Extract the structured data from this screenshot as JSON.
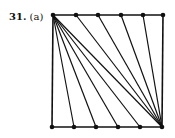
{
  "figure": {
    "number": "31.",
    "part": "(a)"
  },
  "diagram": {
    "stroke": "#111111",
    "square": {
      "tl": [
        53,
        15
      ],
      "tr": [
        163,
        15
      ],
      "br": [
        162,
        127
      ],
      "bl": [
        52,
        127
      ]
    },
    "top_points": [
      [
        53,
        15
      ],
      [
        76,
        15
      ],
      [
        98,
        15
      ],
      [
        121,
        15
      ],
      [
        143,
        15
      ],
      [
        163,
        15
      ]
    ],
    "bottom_points": [
      [
        52,
        127
      ],
      [
        74,
        127
      ],
      [
        96,
        127
      ],
      [
        118,
        127
      ],
      [
        140,
        127
      ],
      [
        162,
        127
      ]
    ]
  }
}
